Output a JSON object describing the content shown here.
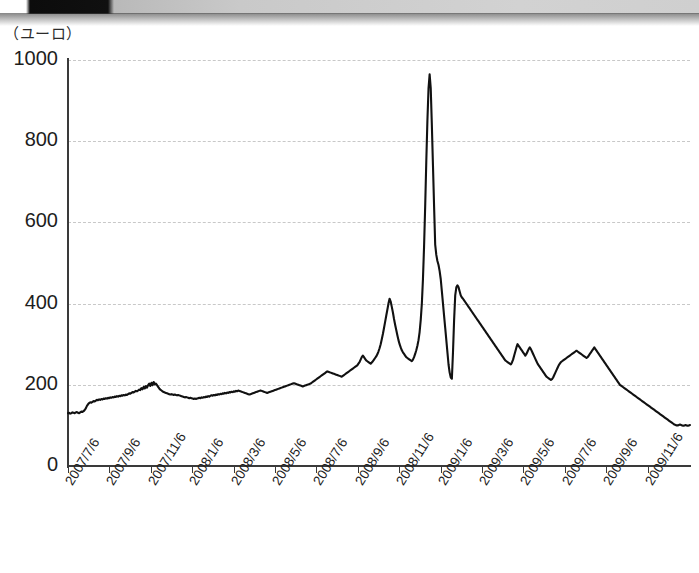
{
  "page": {
    "unit_label": "（ユーロ）",
    "background_color": "#ffffff",
    "line_color": "#111111",
    "grid_color": "#c8c8c8",
    "axis_color": "#3a3a3a"
  },
  "chart_data": {
    "type": "line",
    "title": "",
    "subtitle": "",
    "xlabel": "",
    "ylabel": "（ユーロ）",
    "ylim": [
      0,
      1000
    ],
    "yticks": [
      0,
      200,
      400,
      600,
      800,
      1000
    ],
    "ytick_labels": [
      "0",
      "200",
      "400",
      "600",
      "800",
      "1000"
    ],
    "grid": true,
    "grid_style": "dashed-horizontal",
    "legend": "none",
    "xtick_labels": [
      "2007/7/6",
      "2007/9/6",
      "2007/11/6",
      "2008/1/6",
      "2008/3/6",
      "2008/5/6",
      "2008/7/6",
      "2008/9/6",
      "2008/11/6",
      "2009/1/6",
      "2009/3/6",
      "2009/5/6",
      "2009/7/6",
      "2009/9/6",
      "2009/11/6"
    ],
    "x_start": "2007/7/6",
    "x_end": "2009/12/20",
    "annotations": [
      {
        "text": "peak",
        "x_approx": "2008/10/10",
        "value": 965
      }
    ],
    "series": [
      {
        "name": "price",
        "values": [
          130,
          131,
          129,
          130,
          132,
          131,
          130,
          132,
          133,
          131,
          130,
          132,
          134,
          133,
          135,
          138,
          142,
          148,
          152,
          155,
          157,
          156,
          158,
          160,
          159,
          161,
          163,
          162,
          164,
          163,
          165,
          164,
          166,
          165,
          167,
          166,
          168,
          167,
          169,
          168,
          170,
          169,
          171,
          170,
          172,
          171,
          173,
          172,
          174,
          173,
          175,
          174,
          176,
          175,
          177,
          179,
          178,
          180,
          182,
          181,
          183,
          185,
          184,
          186,
          188,
          187,
          192,
          189,
          195,
          191,
          197,
          193,
          199,
          203,
          197,
          205,
          199,
          207,
          201,
          203,
          199,
          195,
          191,
          188,
          186,
          184,
          182,
          181,
          180,
          179,
          178,
          177,
          176,
          177,
          176,
          175,
          176,
          175,
          174,
          175,
          174,
          173,
          172,
          171,
          170,
          169,
          170,
          169,
          168,
          167,
          168,
          167,
          166,
          165,
          166,
          165,
          166,
          167,
          168,
          167,
          169,
          168,
          170,
          169,
          171,
          170,
          172,
          171,
          173,
          174,
          173,
          175,
          174,
          176,
          175,
          177,
          176,
          178,
          177,
          179,
          178,
          180,
          179,
          181,
          180,
          182,
          181,
          183,
          182,
          184,
          183,
          185,
          184,
          186,
          185,
          184,
          183,
          182,
          181,
          180,
          179,
          178,
          177,
          176,
          177,
          178,
          179,
          180,
          181,
          182,
          183,
          184,
          185,
          186,
          185,
          184,
          183,
          182,
          181,
          180,
          181,
          182,
          183,
          184,
          185,
          186,
          187,
          188,
          189,
          190,
          191,
          192,
          193,
          194,
          195,
          196,
          197,
          198,
          199,
          200,
          201,
          202,
          203,
          204,
          203,
          202,
          201,
          200,
          199,
          198,
          197,
          196,
          197,
          198,
          199,
          200,
          201,
          202,
          203,
          205,
          207,
          209,
          211,
          213,
          215,
          217,
          219,
          221,
          223,
          225,
          227,
          229,
          231,
          233,
          232,
          231,
          230,
          229,
          228,
          227,
          226,
          225,
          224,
          223,
          222,
          221,
          220,
          222,
          224,
          226,
          228,
          230,
          232,
          234,
          236,
          238,
          240,
          242,
          244,
          246,
          248,
          252,
          256,
          262,
          268,
          272,
          268,
          264,
          260,
          258,
          256,
          254,
          252,
          255,
          258,
          262,
          266,
          270,
          275,
          282,
          290,
          300,
          312,
          325,
          340,
          355,
          370,
          385,
          400,
          412,
          405,
          392,
          378,
          362,
          348,
          335,
          322,
          310,
          300,
          292,
          285,
          280,
          276,
          272,
          268,
          266,
          264,
          262,
          260,
          258,
          262,
          268,
          276,
          285,
          296,
          310,
          330,
          360,
          400,
          460,
          540,
          640,
          750,
          850,
          930,
          965,
          930,
          840,
          740,
          640,
          545,
          520,
          505,
          495,
          480,
          460,
          430,
          400,
          370,
          340,
          310,
          280,
          250,
          230,
          218,
          215,
          280,
          360,
          420,
          440,
          445,
          440,
          430,
          420,
          415,
          412,
          408,
          404,
          400,
          396,
          392,
          388,
          384,
          380,
          376,
          372,
          368,
          364,
          360,
          356,
          352,
          348,
          344,
          340,
          336,
          332,
          328,
          324,
          320,
          316,
          312,
          308,
          304,
          300,
          296,
          292,
          288,
          284,
          280,
          276,
          272,
          268,
          264,
          260,
          258,
          256,
          254,
          252,
          250,
          255,
          262,
          272,
          282,
          292,
          300,
          296,
          292,
          288,
          284,
          280,
          276,
          272,
          276,
          282,
          288,
          292,
          288,
          282,
          276,
          270,
          264,
          258,
          252,
          248,
          244,
          240,
          236,
          232,
          228,
          224,
          220,
          218,
          216,
          214,
          212,
          214,
          218,
          224,
          230,
          236,
          242,
          248,
          252,
          256,
          258,
          260,
          262,
          264,
          266,
          268,
          270,
          272,
          274,
          276,
          278,
          280,
          282,
          284,
          282,
          280,
          278,
          276,
          274,
          272,
          270,
          268,
          266,
          268,
          272,
          276,
          280,
          284,
          288,
          292,
          288,
          284,
          280,
          276,
          272,
          268,
          264,
          260,
          256,
          252,
          248,
          244,
          240,
          236,
          232,
          228,
          224,
          220,
          216,
          212,
          208,
          204,
          200,
          198,
          196,
          194,
          192,
          190,
          188,
          186,
          184,
          182,
          180,
          178,
          176,
          174,
          172,
          170,
          168,
          166,
          164,
          162,
          160,
          158,
          156,
          154,
          152,
          150,
          148,
          146,
          144,
          142,
          140,
          138,
          136,
          134,
          132,
          130,
          128,
          126,
          124,
          122,
          120,
          118,
          116,
          114,
          112,
          110,
          108,
          106,
          104,
          102,
          101,
          100,
          100,
          101,
          102,
          101,
          100,
          99,
          100,
          101,
          100,
          99,
          100,
          101
        ]
      }
    ]
  },
  "axes": {
    "y_axis_name": "y-axis",
    "x_axis_name": "x-axis"
  }
}
